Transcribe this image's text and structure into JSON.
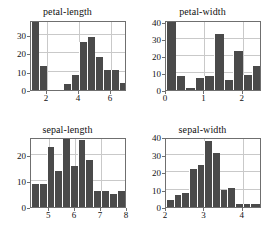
{
  "figure": {
    "background_color": "#ffffff",
    "bar_color": "#4a4a4a",
    "axis_color": "#6f6f6f",
    "grid_color": "#c9c9c9",
    "layout": "2x2 grid of histograms"
  },
  "chart_data": [
    {
      "type": "bar",
      "title": "petal-length",
      "xlabel": "",
      "ylabel": "",
      "grid": true,
      "legend": "none",
      "xlim": [
        1.0,
        7.0
      ],
      "ylim": [
        0,
        38
      ],
      "xticks": [
        2,
        4,
        6
      ],
      "yticks": [
        0,
        10,
        20,
        30
      ],
      "bin_edges": [
        1.0,
        1.5,
        2.0,
        2.5,
        3.0,
        3.5,
        4.0,
        4.5,
        5.0,
        5.5,
        6.0,
        6.5,
        7.0
      ],
      "categories": [
        "1.0-1.5",
        "1.5-2.0",
        "2.0-2.5",
        "2.5-3.0",
        "3.0-3.5",
        "3.5-4.0",
        "4.0-4.5",
        "4.5-5.0",
        "5.0-5.5",
        "5.5-6.0",
        "6.0-6.5",
        "6.5-7.0"
      ],
      "values": [
        37,
        13,
        0,
        0,
        3,
        8,
        26,
        29,
        18,
        11,
        11,
        4
      ]
    },
    {
      "type": "bar",
      "title": "petal-width",
      "xlabel": "",
      "ylabel": "",
      "grid": true,
      "legend": "none",
      "xlim": [
        0.0,
        2.5
      ],
      "ylim": [
        0,
        41
      ],
      "xticks": [
        0,
        1,
        2
      ],
      "yticks": [
        0,
        10,
        20,
        30,
        40
      ],
      "bin_edges": [
        0.0,
        0.25,
        0.5,
        0.75,
        1.0,
        1.25,
        1.5,
        1.75,
        2.0,
        2.25,
        2.5
      ],
      "categories": [
        "0.00-0.25",
        "0.25-0.50",
        "0.50-0.75",
        "0.75-1.00",
        "1.00-1.25",
        "1.25-1.50",
        "1.50-1.75",
        "1.75-2.00",
        "2.00-2.25",
        "2.25-2.50"
      ],
      "values": [
        41,
        8,
        1,
        7,
        8,
        33,
        6,
        23,
        9,
        14
      ]
    },
    {
      "type": "bar",
      "title": "sepal-length",
      "xlabel": "",
      "ylabel": "",
      "grid": true,
      "legend": "none",
      "xlim": [
        4.3,
        8.0
      ],
      "ylim": [
        0,
        27
      ],
      "xticks": [
        5,
        6,
        7,
        8
      ],
      "yticks": [
        0,
        10,
        20
      ],
      "bin_edges": [
        4.3,
        4.6,
        4.9,
        5.2,
        5.5,
        5.8,
        6.1,
        6.4,
        6.7,
        7.0,
        7.3,
        7.6,
        8.0
      ],
      "categories": [
        "4.3-4.6",
        "4.6-4.9",
        "4.9-5.2",
        "5.2-5.5",
        "5.5-5.8",
        "5.8-6.1",
        "6.1-6.4",
        "6.4-6.7",
        "6.7-7.0",
        "7.0-7.3",
        "7.3-7.6",
        "7.6-8.0"
      ],
      "values": [
        9,
        9,
        23,
        14,
        27,
        16,
        26,
        18,
        6,
        6,
        5,
        6
      ]
    },
    {
      "type": "bar",
      "title": "sepal-width",
      "xlabel": "",
      "ylabel": "",
      "grid": true,
      "legend": "none",
      "xlim": [
        2.0,
        4.5
      ],
      "ylim": [
        0,
        40
      ],
      "xticks": [
        2,
        3,
        4
      ],
      "yticks": [
        0,
        10,
        20,
        30,
        40
      ],
      "bin_edges": [
        2.0,
        2.2,
        2.4,
        2.6,
        2.8,
        3.0,
        3.2,
        3.4,
        3.6,
        3.8,
        4.0,
        4.2,
        4.5
      ],
      "categories": [
        "2.0-2.2",
        "2.2-2.4",
        "2.4-2.6",
        "2.6-2.8",
        "2.8-3.0",
        "3.0-3.2",
        "3.2-3.4",
        "3.4-3.6",
        "3.6-3.8",
        "3.8-4.0",
        "4.0-4.2",
        "4.2-4.5"
      ],
      "values": [
        4,
        7,
        8,
        22,
        24,
        38,
        31,
        10,
        11,
        2,
        2,
        2
      ]
    }
  ]
}
